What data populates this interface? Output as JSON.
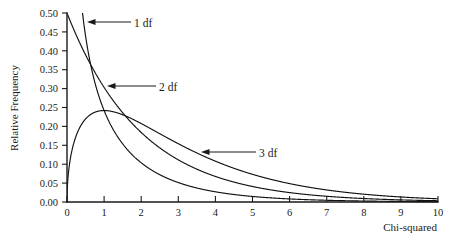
{
  "chart_data": {
    "type": "line",
    "title": "",
    "xlabel": "Chi-squared",
    "ylabel": "Relative Frequency",
    "xlim": [
      0,
      10
    ],
    "ylim": [
      0,
      0.5
    ],
    "grid": false,
    "legend_position": "inline-annotations",
    "xticks": [
      "0",
      "1",
      "2",
      "3",
      "4",
      "5",
      "6",
      "7",
      "8",
      "9",
      "10"
    ],
    "xtick_values": [
      0,
      1,
      2,
      3,
      4,
      5,
      6,
      7,
      8,
      9,
      10
    ],
    "yticks": [
      "0.00",
      "0.05",
      "0.10",
      "0.15",
      "0.20",
      "0.25",
      "0.30",
      "0.35",
      "0.40",
      "0.45",
      "0.50"
    ],
    "ytick_values": [
      0.0,
      0.05,
      0.1,
      0.15,
      0.2,
      0.25,
      0.3,
      0.35,
      0.4,
      0.45,
      0.5
    ],
    "x": [
      0,
      0.1,
      0.2,
      0.3,
      0.4,
      0.5,
      0.6,
      0.7,
      0.8,
      0.9,
      1.0,
      1.2,
      1.4,
      1.6,
      1.8,
      2.0,
      2.5,
      3.0,
      3.5,
      4.0,
      4.5,
      5.0,
      5.5,
      6.0,
      6.5,
      7.0,
      7.5,
      8.0,
      8.5,
      9.0,
      9.5,
      10.0
    ],
    "series": [
      {
        "name": "1 df",
        "label": "1 df",
        "df": 1,
        "color": "#111111",
        "clipped_at_top": true,
        "values": [
          null,
          1.2004,
          0.8071,
          0.627,
          0.516,
          0.4394,
          0.3828,
          0.3391,
          0.3041,
          0.2755,
          0.2516,
          0.2137,
          0.185,
          0.1624,
          0.1441,
          0.129,
          0.101,
          0.0807,
          0.0653,
          0.0535,
          0.044,
          0.0364,
          0.0303,
          0.0253,
          0.0212,
          0.0178,
          0.015,
          0.0127,
          0.0107,
          0.0091,
          0.0077,
          0.0066
        ]
      },
      {
        "name": "2 df",
        "label": "2 df",
        "df": 2,
        "color": "#111111",
        "values": [
          0.5,
          0.4756,
          0.4524,
          0.4304,
          0.4094,
          0.3894,
          0.3704,
          0.3523,
          0.3352,
          0.3188,
          0.3033,
          0.2744,
          0.2483,
          0.2247,
          0.2033,
          0.1839,
          0.1433,
          0.1116,
          0.0869,
          0.0677,
          0.0527,
          0.041,
          0.032,
          0.0249,
          0.0194,
          0.0151,
          0.0118,
          0.0092,
          0.0071,
          0.0055,
          0.0043,
          0.0034
        ]
      },
      {
        "name": "3 df",
        "label": "3 df",
        "df": 3,
        "color": "#111111",
        "peak_x": 1.0,
        "peak_y": 0.242,
        "values": [
          0.0,
          0.12,
          0.161,
          0.1879,
          0.2064,
          0.2197,
          0.2296,
          0.2371,
          0.2429,
          0.2474,
          0.242,
          0.2404,
          0.2321,
          0.2215,
          0.2097,
          0.1976,
          0.1684,
          0.1402,
          0.1148,
          0.0927,
          0.074,
          0.0585,
          0.0459,
          0.0357,
          0.0277,
          0.0213,
          0.0164,
          0.0126,
          0.0096,
          0.0073,
          0.0055,
          0.0042
        ]
      }
    ],
    "annotations": [
      {
        "text": "1 df",
        "points_at_series": "1 df"
      },
      {
        "text": "2 df",
        "points_at_series": "2 df"
      },
      {
        "text": "3 df",
        "points_at_series": "3 df"
      }
    ]
  }
}
